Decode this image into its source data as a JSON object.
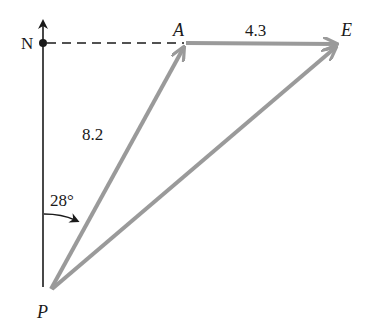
{
  "diagram": {
    "type": "vector-addition",
    "labels": {
      "north": "N",
      "point_a": "A",
      "point_e": "E",
      "point_p": "P",
      "vector_ae_magnitude": "4.3",
      "vector_pa_magnitude": "8.2",
      "angle": "28°"
    },
    "points": {
      "N": [
        43,
        43
      ],
      "A": [
        185,
        43
      ],
      "E": [
        338,
        44
      ],
      "P": [
        50,
        290
      ]
    },
    "vectors": [
      {
        "from": "P",
        "to": "A",
        "magnitude": 8.2
      },
      {
        "from": "A",
        "to": "E",
        "magnitude": 4.3
      },
      {
        "from": "P",
        "to": "E",
        "magnitude": null
      }
    ],
    "angle_from_north_deg": 28,
    "colors": {
      "vector": "#9a9a9a",
      "axis": "#1a1a1a",
      "background": "#ffffff"
    }
  }
}
